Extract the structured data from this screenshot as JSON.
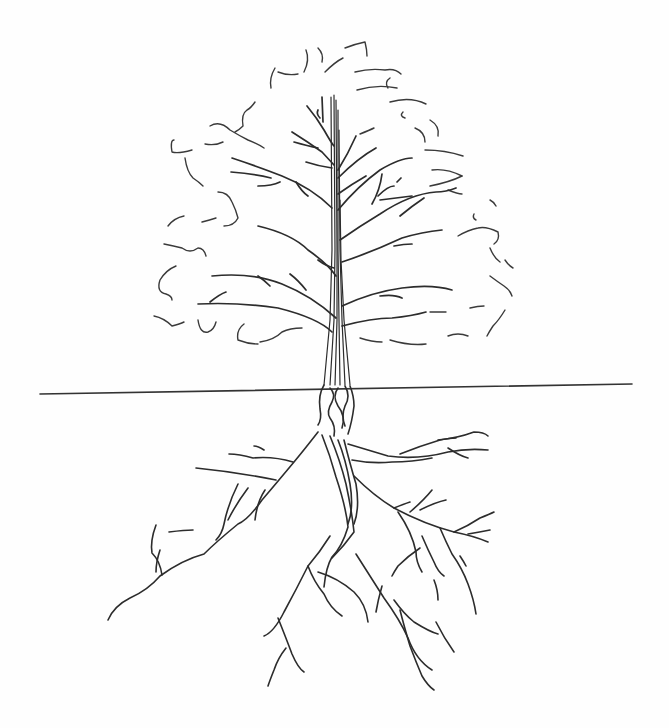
{
  "image": {
    "subject": "pencil sketch of a tree with its root system",
    "description": "Line drawing of a deciduous tree: a loose wavy-outline crown with branching limbs above a horizontal ground line, and a spreading root system below",
    "colors": {
      "background": "#fefefe",
      "line": "#2c2c2c"
    },
    "elements": [
      "crown-outline",
      "trunk",
      "branches",
      "ground-line",
      "roots"
    ]
  }
}
